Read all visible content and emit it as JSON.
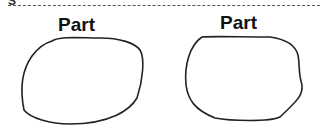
{
  "header": {
    "partial_glyph": "S",
    "cut_line": "dashed"
  },
  "parts": [
    {
      "label": "Part",
      "shape": "rounded-blob"
    },
    {
      "label": "Part",
      "shape": "rounded-blob-irregular"
    }
  ],
  "colors": {
    "stroke": "#222222",
    "background": "#ffffff",
    "dashed_line": "#555555"
  }
}
